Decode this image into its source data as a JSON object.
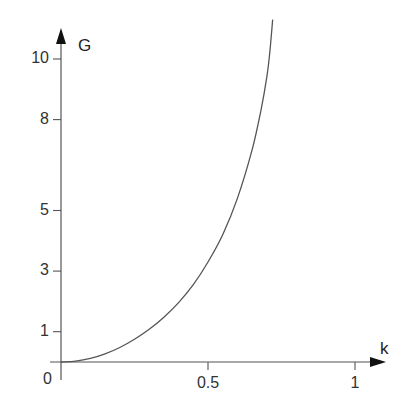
{
  "chart_data": {
    "type": "line",
    "title": "",
    "xlabel": "k",
    "ylabel": "G",
    "xlim": [
      0,
      1.08
    ],
    "ylim": [
      0,
      11.5
    ],
    "grid": false,
    "legend": null,
    "x_ticks": [
      {
        "value": 0,
        "label": "0"
      },
      {
        "value": 0.5,
        "label": "0.5"
      },
      {
        "value": 1,
        "label": "1"
      }
    ],
    "y_ticks": [
      {
        "value": 1,
        "label": "1"
      },
      {
        "value": 3,
        "label": "3"
      },
      {
        "value": 5,
        "label": "5"
      },
      {
        "value": 8,
        "label": "8"
      },
      {
        "value": 10,
        "label": "10"
      }
    ],
    "series": [
      {
        "name": "G(k)",
        "color": "#555555",
        "x": [
          0.0,
          0.05,
          0.1,
          0.15,
          0.2,
          0.25,
          0.3,
          0.35,
          0.4,
          0.45,
          0.5,
          0.55,
          0.6,
          0.65,
          0.68,
          0.7,
          0.71,
          0.72
        ],
        "y": [
          0.0,
          0.03,
          0.12,
          0.27,
          0.48,
          0.75,
          1.08,
          1.48,
          1.96,
          2.55,
          3.3,
          4.2,
          5.4,
          7.0,
          8.3,
          9.4,
          10.2,
          11.3
        ]
      }
    ]
  },
  "axes": {
    "x_label": "k",
    "y_label": "G",
    "origin_label": "0"
  }
}
